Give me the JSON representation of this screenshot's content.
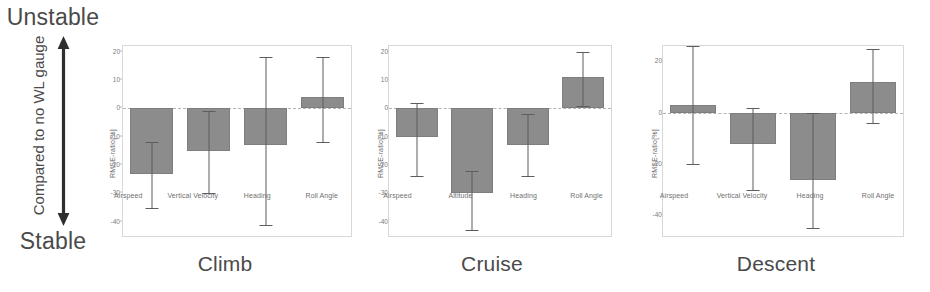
{
  "annotation": {
    "top_label": "Unstable",
    "bottom_label": "Stable",
    "axis_label": "Compared to no WL gauge",
    "arrow_icon": "double-headed-vertical-arrow-icon"
  },
  "chart_data": [
    {
      "type": "bar",
      "title": "Climb",
      "xlabel": "",
      "ylabel": "RMSE-ratio[%]",
      "ylim": [
        -45,
        22
      ],
      "yticks": [
        20,
        10,
        0,
        -10,
        -20,
        -30,
        -40
      ],
      "ytick_labels": [
        "20",
        "10",
        "0",
        "-10",
        "-20",
        "-30",
        "-40"
      ],
      "grid": false,
      "zero_reference_line": 0,
      "categories": [
        "Airspeed",
        "Vertical Velocity",
        "Heading",
        "Roll Angle"
      ],
      "values": [
        -23,
        -15,
        -13,
        4
      ],
      "error_low": [
        -35,
        -30,
        -41,
        -12
      ],
      "error_high": [
        -12,
        -1,
        18,
        18
      ],
      "bar_color": "#8c8c8c",
      "error_color": "#5d5d5d"
    },
    {
      "type": "bar",
      "title": "Cruise",
      "xlabel": "",
      "ylabel": "RMSE-ratio[%]",
      "ylim": [
        -45,
        22
      ],
      "yticks": [
        20,
        10,
        0,
        -10,
        -20,
        -30,
        -40
      ],
      "ytick_labels": [
        "20",
        "10",
        "0",
        "-10",
        "-20",
        "-30",
        "-40"
      ],
      "grid": false,
      "zero_reference_line": 0,
      "categories": [
        "Airspeed",
        "Altitude",
        "Heading",
        "Roll Angle"
      ],
      "values": [
        -10,
        -30,
        -13,
        11
      ],
      "error_low": [
        -24,
        -43,
        -24,
        1
      ],
      "error_high": [
        2,
        -22,
        -2,
        20
      ],
      "bar_color": "#8c8c8c",
      "error_color": "#5d5d5d"
    },
    {
      "type": "bar",
      "title": "Descent",
      "xlabel": "",
      "ylabel": "RMSE-ratio[%]",
      "ylim": [
        -48,
        26
      ],
      "yticks": [
        20,
        0,
        -20,
        -40
      ],
      "ytick_labels": [
        "20",
        "0",
        "-20",
        "-40"
      ],
      "grid": false,
      "zero_reference_line": 0,
      "categories": [
        "Airspeed",
        "Vertical Velocity",
        "Heading",
        "Roll Angle"
      ],
      "values": [
        3,
        -12,
        -26,
        12
      ],
      "error_low": [
        -20,
        -30,
        -45,
        -4
      ],
      "error_high": [
        26,
        2,
        0,
        25
      ],
      "bar_color": "#8c8c8c",
      "error_color": "#5d5d5d"
    }
  ]
}
